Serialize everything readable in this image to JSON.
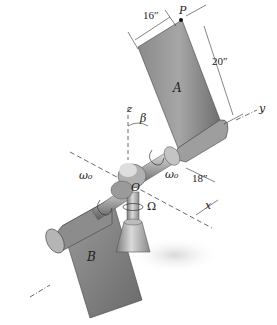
{
  "figure": {
    "labels": {
      "point_p": "P",
      "plate_a": "A",
      "plate_b": "B",
      "origin": "O",
      "axis_x": "x",
      "axis_y": "y",
      "axis_z": "z",
      "angle_beta": "β",
      "omega0_left": "ω₀",
      "omega0_right": "ω₀",
      "omega_big": "Ω"
    },
    "dimensions": {
      "plate_width": "16″",
      "plate_height": "20″",
      "offset": "18″"
    },
    "colors": {
      "metal_dark": "#6e6e6e",
      "metal_mid": "#9a9a9a",
      "metal_light": "#d2d2d2",
      "line": "#333333",
      "background": "#ffffff"
    }
  }
}
